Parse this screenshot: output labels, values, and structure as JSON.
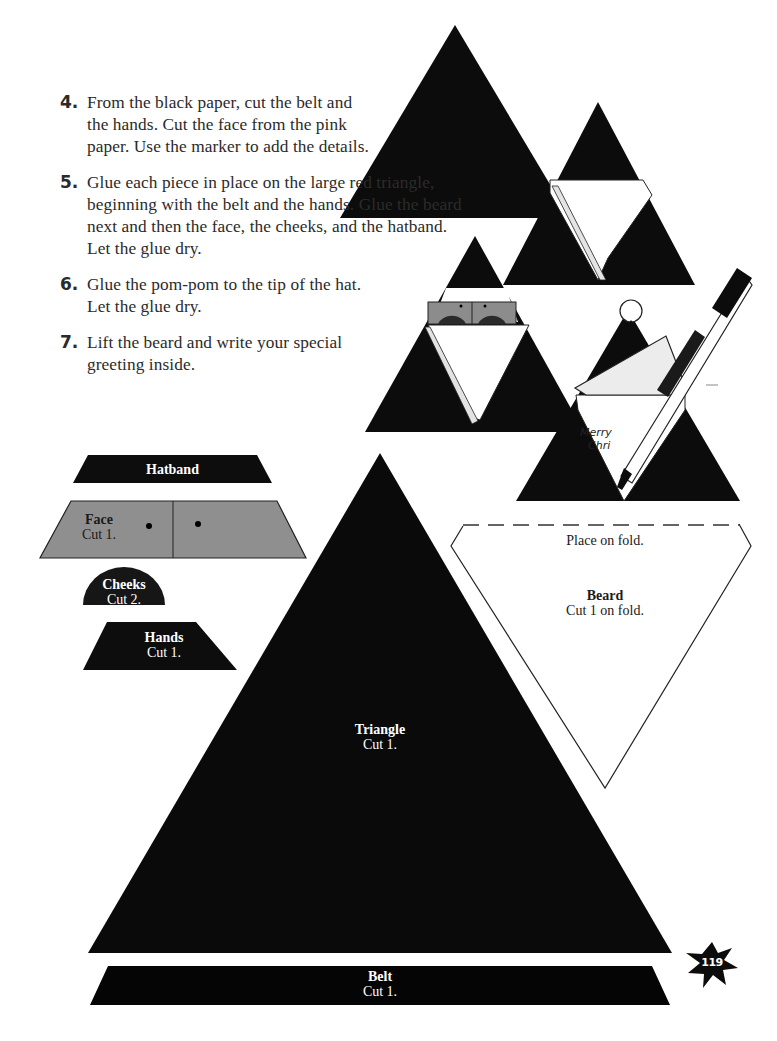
{
  "instructions": {
    "steps": [
      {
        "number": "4.",
        "text": "From the black paper, cut the belt and the hands. Cut the face from the pink paper. Use the marker to add the details."
      },
      {
        "number": "5.",
        "text": "Glue each piece in place on the large red triangle, beginning with the belt and the hands. Glue the beard next and then the face, the cheeks, and the hatband. Let the glue dry."
      },
      {
        "number": "6.",
        "text": "Glue the pom-pom to the tip of the hat. Let the glue dry."
      },
      {
        "number": "7.",
        "text": "Lift the beard and write your special greeting inside."
      }
    ]
  },
  "illustration": {
    "card_greeting_line1": "Merry",
    "card_greeting_line2": "Chri"
  },
  "patterns": {
    "hatband": {
      "title": "Hatband",
      "color": "#0d0d0d"
    },
    "face": {
      "title": "Face",
      "cut": "Cut 1.",
      "color": "#8f8f8f"
    },
    "cheeks": {
      "title": "Cheeks",
      "cut": "Cut 2.",
      "color": "#161616"
    },
    "hands": {
      "title": "Hands",
      "cut": "Cut 1.",
      "color": "#0d0d0d"
    },
    "triangle": {
      "title": "Triangle",
      "cut": "Cut 1.",
      "color": "#0a0a0a"
    },
    "beard": {
      "fold_note": "Place on fold.",
      "title": "Beard",
      "cut": "Cut 1 on fold.",
      "color": "#ffffff"
    },
    "belt": {
      "title": "Belt",
      "cut": "Cut 1.",
      "color": "#050505"
    }
  },
  "page": {
    "number": "119"
  }
}
